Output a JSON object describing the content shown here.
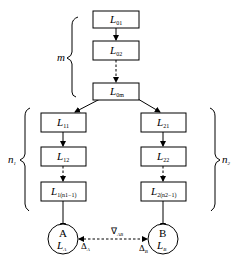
{
  "diagram": {
    "top_chain": [
      {
        "id": "L01",
        "main": "L",
        "sub": "01"
      },
      {
        "id": "L02",
        "main": "L",
        "sub": "02"
      },
      {
        "id": "L0m",
        "main": "L",
        "sub": "0m"
      }
    ],
    "left_chain": [
      {
        "id": "L11",
        "main": "L",
        "sub": "11"
      },
      {
        "id": "L12",
        "main": "L",
        "sub": "12"
      },
      {
        "id": "L1n1-1",
        "main": "L",
        "sub": "1(n1−1)"
      }
    ],
    "right_chain": [
      {
        "id": "L21",
        "main": "L",
        "sub": "21"
      },
      {
        "id": "L22",
        "main": "L",
        "sub": "22"
      },
      {
        "id": "L2n2-1",
        "main": "L",
        "sub": "2(n2−1)"
      }
    ],
    "nodes": {
      "A": {
        "letter": "A",
        "main": "L",
        "sub": "A",
        "delta": "Δ",
        "delta_sub": "A"
      },
      "B": {
        "letter": "B",
        "main": "L",
        "sub": "B",
        "delta": "Δ",
        "delta_sub": "B"
      }
    },
    "link_label": {
      "main": "∇",
      "sub": "AB"
    },
    "braces": {
      "top": {
        "label": "m"
      },
      "left": {
        "label": "n",
        "sub": "1"
      },
      "right": {
        "label": "n",
        "sub": "2"
      }
    },
    "edges": [
      {
        "from": "L01",
        "to": "L02",
        "style": "solid"
      },
      {
        "from": "L02",
        "to": "L0m",
        "style": "dashed"
      },
      {
        "from": "L0m",
        "to": "L11",
        "style": "solid"
      },
      {
        "from": "L0m",
        "to": "L21",
        "style": "solid"
      },
      {
        "from": "L11",
        "to": "L12",
        "style": "solid"
      },
      {
        "from": "L12",
        "to": "L1n1-1",
        "style": "dashed"
      },
      {
        "from": "L21",
        "to": "L22",
        "style": "solid"
      },
      {
        "from": "L22",
        "to": "L2n2-1",
        "style": "dashed"
      },
      {
        "from": "L1n1-1",
        "to": "A",
        "style": "solid"
      },
      {
        "from": "L2n2-1",
        "to": "B",
        "style": "solid"
      },
      {
        "from": "A",
        "to": "B",
        "style": "dashed-bidirectional"
      }
    ]
  }
}
